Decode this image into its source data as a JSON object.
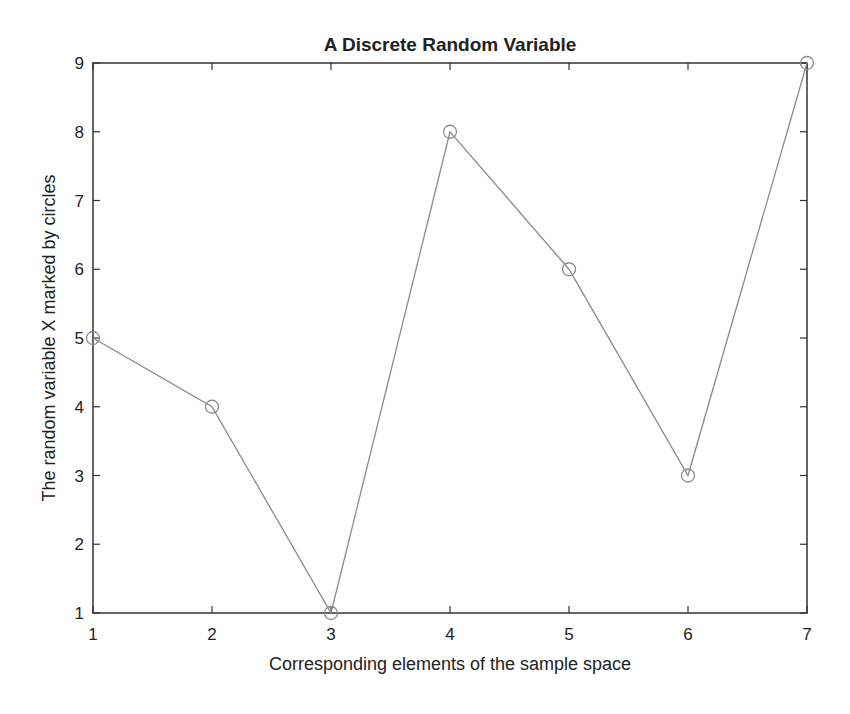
{
  "chart_data": {
    "type": "line",
    "title": "A Discrete Random Variable",
    "xlabel": "Corresponding elements of the sample space",
    "ylabel": "The random variable X marked by circles",
    "x": [
      1,
      2,
      3,
      4,
      5,
      6,
      7
    ],
    "values": [
      5,
      4,
      1,
      8,
      6,
      3,
      9
    ],
    "series": [
      {
        "name": "X",
        "marker": "circle",
        "color": "#8a8a8a",
        "values": [
          5,
          4,
          1,
          8,
          6,
          3,
          9
        ]
      }
    ],
    "xlim": [
      1,
      7
    ],
    "ylim": [
      1,
      9
    ],
    "xticks": [
      1,
      2,
      3,
      4,
      5,
      6,
      7
    ],
    "yticks": [
      1,
      2,
      3,
      4,
      5,
      6,
      7,
      8,
      9
    ],
    "grid": false,
    "legend": null
  },
  "colors": {
    "axis": "#333333",
    "line": "#8a8a8a",
    "text": "#222222"
  }
}
